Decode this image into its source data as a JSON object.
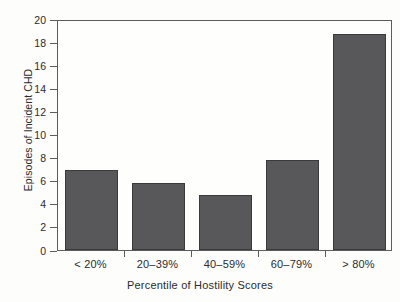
{
  "chart_data": {
    "type": "bar",
    "title": "",
    "xlabel": "Percentile of Hostility Scores",
    "ylabel": "Episodes of Incident CHD",
    "categories": [
      "< 20%",
      "20–39%",
      "40–59%",
      "60–79%",
      "> 80%"
    ],
    "values": [
      6.9,
      5.8,
      4.8,
      7.8,
      18.7
    ],
    "ylim": [
      0,
      20
    ],
    "yticks": [
      0,
      2,
      4,
      6,
      8,
      10,
      12,
      14,
      16,
      18,
      20
    ],
    "ytick_labels": [
      "0",
      "2",
      "4",
      "6",
      "8",
      "10",
      "12",
      "14",
      "16",
      "18",
      "20"
    ],
    "grid": false,
    "legend": null,
    "bar_color": "#58585a",
    "bar_edge_color": "#3a3a3c",
    "axis_color": "#5c5c5c",
    "text_color": "#2b2b2b",
    "background": "#fdfdfc"
  }
}
